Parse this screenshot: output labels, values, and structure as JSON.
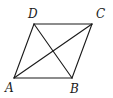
{
  "diagram": {
    "type": "parallelogram-with-diagonals",
    "stroke_color": "#1a1a1a",
    "background": "#ffffff",
    "vertices": {
      "A": {
        "label": "A",
        "x": 14,
        "y": 78,
        "label_x": 5,
        "label_y": 82
      },
      "B": {
        "label": "B",
        "x": 72,
        "y": 78,
        "label_x": 70,
        "label_y": 83
      },
      "C": {
        "label": "C",
        "x": 92,
        "y": 24,
        "label_x": 96,
        "label_y": 8
      },
      "D": {
        "label": "D",
        "x": 34,
        "y": 24,
        "label_x": 28,
        "label_y": 8
      }
    },
    "sides": [
      {
        "from": "A",
        "to": "B"
      },
      {
        "from": "B",
        "to": "C"
      },
      {
        "from": "C",
        "to": "D"
      },
      {
        "from": "D",
        "to": "A"
      }
    ],
    "diagonals": [
      {
        "from": "A",
        "to": "C"
      },
      {
        "from": "B",
        "to": "D"
      }
    ]
  }
}
